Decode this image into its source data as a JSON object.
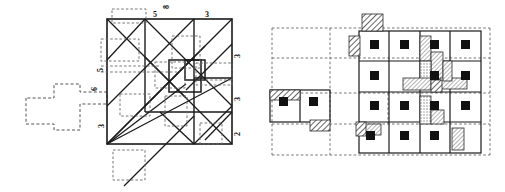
{
  "figure": {
    "title": "",
    "caption": "",
    "background_color": "#ffffff",
    "ink_color": "#1a1a1a",
    "panels": [
      {
        "id": "left-panel",
        "name": "square-dissection-diagram",
        "description": "Large square subdivided into rectangles with solid and dashed guide lines, diagonals, a small central square, and a dashed polyomino attached on the left side",
        "edge_labels": {
          "top": [
            "5",
            "3"
          ],
          "top_extra": "8",
          "left": [
            "5",
            "6",
            "3"
          ],
          "right": [
            "3",
            "3",
            "2"
          ]
        }
      },
      {
        "id": "right-panel",
        "name": "grid-packing-diagram",
        "description": "Rectangular grid of cells, each containing a small filled black square, with hatched shaded blocks along some cell edges and a dashed bounding lattice",
        "cell_marker": "filled-black-square",
        "shading": "diagonal-hatch",
        "grid_columns": 4,
        "grid_rows": 4,
        "detached_block_cells": 2
      }
    ],
    "colors": {
      "line": "#1a1a1a",
      "dashed": "#555555",
      "marker_fill": "#111111",
      "hatch_fill": "#8a8a8a"
    }
  },
  "labels": {
    "top_5": "5",
    "top_3": "3",
    "top_8": "8",
    "left_5": "5",
    "left_6": "6",
    "left_3": "3",
    "right_3a": "3",
    "right_3b": "3",
    "right_2": "2"
  }
}
